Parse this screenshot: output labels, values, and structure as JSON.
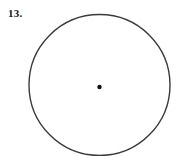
{
  "page": {
    "background_color": "#ffffff",
    "width": 181,
    "height": 156
  },
  "exercise": {
    "number_label": "13."
  },
  "figure": {
    "type": "circle-with-center-point",
    "stroke_color": "#3a3a3a",
    "stroke_width": 1.4,
    "fill": "none",
    "center": {
      "x": 99.5,
      "y": 85,
      "dot_radius": 2.2,
      "dot_color": "#111111"
    },
    "radius": 70.5,
    "bounds": {
      "left": 29,
      "right": 170,
      "top": 14.5,
      "bottom": 155.5
    },
    "cropped_at_bottom": true
  }
}
